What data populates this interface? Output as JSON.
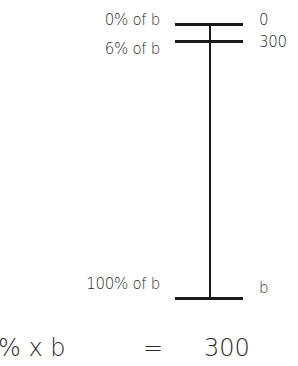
{
  "diagram": {
    "left_labels": [
      "0% of b",
      "6% of b",
      "100% of b"
    ],
    "right_labels": [
      "0",
      "300",
      "b"
    ]
  },
  "equation": {
    "lhs": "% x b",
    "eq": "=",
    "rhs": "300"
  }
}
